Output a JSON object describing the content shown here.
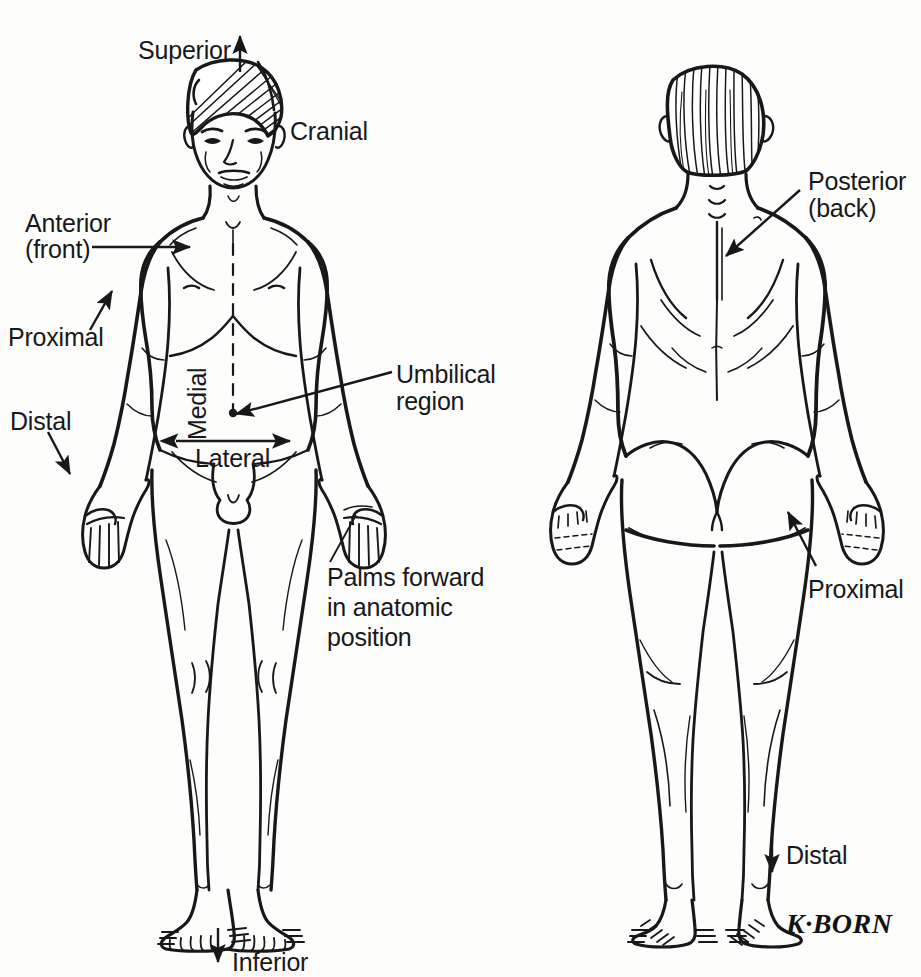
{
  "figure": {
    "background_color": "#fdfdfc",
    "ink_color": "#18181a",
    "signature": "K·BORN"
  },
  "labels": {
    "superior": "Superior",
    "cranial": "Cranial",
    "anterior_line1": "Anterior",
    "anterior_line2": "(front)",
    "proximal_left": "Proximal",
    "distal_left": "Distal",
    "medial": "Medial",
    "lateral": "Lateral",
    "umbilical_line1": "Umbilical",
    "umbilical_line2": "region",
    "palms_line1": "Palms forward",
    "palms_line2": "in anatomic",
    "palms_line3": "position",
    "inferior": "Inferior",
    "posterior_line1": "Posterior",
    "posterior_line2": "(back)",
    "proximal_right": "Proximal",
    "distal_right": "Distal"
  },
  "views": {
    "anterior_view_name": "anterior-body-figure",
    "posterior_view_name": "posterior-body-figure"
  }
}
